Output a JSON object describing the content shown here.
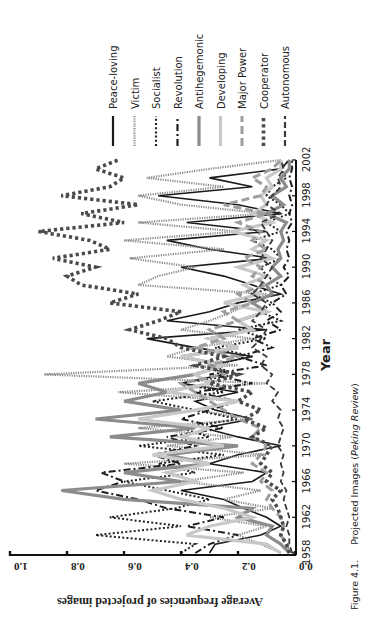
{
  "figure": {
    "caption_label": "Figure 4.1.",
    "caption_text": "Projected Images (",
    "caption_italic": "Peking Review",
    "caption_close": ")"
  },
  "chart_data": {
    "type": "line",
    "title": "Projected Images (Peking Review)",
    "xlabel": "Year",
    "ylabel": "Average frequencies of projected images",
    "xlim": [
      1958,
      2002
    ],
    "ylim": [
      0.0,
      1.0
    ],
    "x_ticks": [
      1958,
      1962,
      1966,
      1970,
      1974,
      1978,
      1982,
      1986,
      1990,
      1994,
      1998,
      2002
    ],
    "y_ticks": [
      "0.0",
      "0.2",
      "0.4",
      "0.6",
      "0.8",
      "1.0"
    ],
    "grid": false,
    "legend_position": "right (top of rotated page)",
    "orientation": "rotated 90deg counter-clockwise on page",
    "x": [
      1958,
      1959,
      1960,
      1961,
      1962,
      1963,
      1964,
      1965,
      1966,
      1967,
      1968,
      1969,
      1970,
      1971,
      1972,
      1973,
      1974,
      1975,
      1976,
      1977,
      1978,
      1979,
      1980,
      1981,
      1982,
      1983,
      1984,
      1985,
      1986,
      1987,
      1988,
      1989,
      1990,
      1991,
      1992,
      1993,
      1994,
      1995,
      1996,
      1997,
      1998,
      1999,
      2000,
      2001,
      2002
    ],
    "series": [
      {
        "name": "Peace-loving",
        "style": "solid",
        "color": "#1a1a1a",
        "width": 1.6,
        "values": [
          0.3,
          0.28,
          0.12,
          0.05,
          0.1,
          0.18,
          0.25,
          0.4,
          0.15,
          0.1,
          0.3,
          0.2,
          0.05,
          0.2,
          0.32,
          0.15,
          0.28,
          0.35,
          0.2,
          0.4,
          0.25,
          0.3,
          0.15,
          0.35,
          0.52,
          0.1,
          0.45,
          0.3,
          0.2,
          0.05,
          0.15,
          0.25,
          0.4,
          0.08,
          0.3,
          0.45,
          0.1,
          0.38,
          0.05,
          0.2,
          0.48,
          0.15,
          0.3,
          0.05,
          0.02
        ]
      },
      {
        "name": "Victim",
        "style": "dotted-fine",
        "color": "#8a8a8a",
        "width": 2.2,
        "values": [
          0.05,
          0.12,
          0.2,
          0.1,
          0.3,
          0.08,
          0.25,
          0.12,
          0.4,
          0.18,
          0.6,
          0.1,
          0.45,
          0.22,
          0.55,
          0.15,
          0.35,
          0.2,
          0.62,
          0.1,
          0.88,
          0.2,
          0.45,
          0.35,
          0.15,
          0.4,
          0.3,
          0.22,
          0.15,
          0.1,
          0.55,
          0.48,
          0.35,
          0.58,
          0.25,
          0.6,
          0.2,
          0.55,
          0.1,
          0.4,
          0.55,
          0.25,
          0.52,
          0.3,
          0.05
        ]
      },
      {
        "name": "Socialist",
        "style": "dotted",
        "color": "#222222",
        "width": 2.0,
        "values": [
          0.4,
          0.35,
          0.7,
          0.4,
          0.65,
          0.42,
          0.3,
          0.45,
          0.6,
          0.35,
          0.48,
          0.25,
          0.55,
          0.3,
          0.4,
          0.2,
          0.35,
          0.5,
          0.25,
          0.4,
          0.2,
          0.3,
          0.15,
          0.28,
          0.1,
          0.2,
          0.05,
          0.12,
          0.08,
          0.15,
          0.05,
          0.1,
          0.12,
          0.05,
          0.08,
          0.15,
          0.05,
          0.1,
          0.02,
          0.05,
          0.1,
          0.08,
          0.03,
          0.05,
          0.02
        ]
      },
      {
        "name": "Revolution",
        "style": "dashdot",
        "color": "#1e1e1e",
        "width": 2.0,
        "values": [
          0.35,
          0.3,
          0.2,
          0.38,
          0.25,
          0.45,
          0.55,
          0.7,
          0.6,
          0.68,
          0.4,
          0.5,
          0.35,
          0.45,
          0.25,
          0.4,
          0.3,
          0.2,
          0.35,
          0.15,
          0.3,
          0.1,
          0.2,
          0.08,
          0.15,
          0.05,
          0.1,
          0.05,
          0.08,
          0.03,
          0.05,
          0.02,
          0.04,
          0.02,
          0.03,
          0.02,
          0.03,
          0.01,
          0.02,
          0.01,
          0.02,
          0.01,
          0.02,
          0.01,
          0.01
        ]
      },
      {
        "name": "Antihegemonic",
        "style": "solid-thick",
        "color": "#8c8c8c",
        "width": 3.2,
        "values": [
          0.02,
          0.05,
          0.1,
          0.08,
          0.2,
          0.15,
          0.6,
          0.82,
          0.4,
          0.6,
          0.3,
          0.45,
          0.2,
          0.65,
          0.35,
          0.7,
          0.4,
          0.6,
          0.45,
          0.55,
          0.35,
          0.25,
          0.4,
          0.2,
          0.3,
          0.15,
          0.2,
          0.1,
          0.15,
          0.08,
          0.1,
          0.05,
          0.08,
          0.05,
          0.06,
          0.04,
          0.05,
          0.03,
          0.1,
          0.04,
          0.08,
          0.03,
          0.05,
          0.02,
          0.02
        ]
      },
      {
        "name": "Developing",
        "style": "solid-thick",
        "color": "#c8c8c8",
        "width": 3.2,
        "values": [
          0.05,
          0.1,
          0.38,
          0.3,
          0.15,
          0.25,
          0.4,
          0.5,
          0.35,
          0.45,
          0.3,
          0.5,
          0.25,
          0.4,
          0.3,
          0.55,
          0.35,
          0.2,
          0.45,
          0.3,
          0.35,
          0.25,
          0.4,
          0.2,
          0.3,
          0.15,
          0.2,
          0.1,
          0.25,
          0.12,
          0.18,
          0.1,
          0.2,
          0.08,
          0.15,
          0.1,
          0.22,
          0.08,
          0.15,
          0.1,
          0.12,
          0.08,
          0.1,
          0.05,
          0.05
        ]
      },
      {
        "name": "Major Power",
        "style": "dashed-thick",
        "color": "#9e9e9e",
        "width": 3.0,
        "values": [
          0.02,
          0.03,
          0.05,
          0.04,
          0.05,
          0.08,
          0.1,
          0.08,
          0.12,
          0.1,
          0.15,
          0.12,
          0.1,
          0.15,
          0.12,
          0.2,
          0.25,
          0.3,
          0.35,
          0.4,
          0.25,
          0.3,
          0.2,
          0.35,
          0.25,
          0.3,
          0.2,
          0.25,
          0.15,
          0.2,
          0.1,
          0.15,
          0.12,
          0.18,
          0.1,
          0.15,
          0.12,
          0.2,
          0.1,
          0.25,
          0.12,
          0.1,
          0.15,
          0.08,
          0.05
        ]
      },
      {
        "name": "Cooperator",
        "style": "dotted-heavy",
        "color": "#4a4a4a",
        "width": 3.6,
        "values": [
          0.02,
          0.03,
          0.05,
          0.04,
          0.05,
          0.06,
          0.08,
          0.05,
          0.1,
          0.08,
          0.12,
          0.1,
          0.08,
          0.15,
          0.1,
          0.18,
          0.12,
          0.2,
          0.15,
          0.3,
          0.2,
          0.35,
          0.25,
          0.4,
          0.45,
          0.58,
          0.48,
          0.4,
          0.65,
          0.55,
          0.75,
          0.8,
          0.7,
          0.85,
          0.65,
          0.72,
          0.9,
          0.6,
          0.75,
          0.55,
          0.82,
          0.65,
          0.6,
          0.7,
          0.62
        ]
      },
      {
        "name": "Autonomous",
        "style": "dashed",
        "color": "#3a3a3a",
        "width": 1.8,
        "values": [
          0.01,
          0.02,
          0.02,
          0.03,
          0.02,
          0.03,
          0.04,
          0.03,
          0.05,
          0.04,
          0.05,
          0.04,
          0.06,
          0.05,
          0.04,
          0.06,
          0.05,
          0.08,
          0.06,
          0.1,
          0.08,
          0.12,
          0.1,
          0.15,
          0.12,
          0.1,
          0.15,
          0.12,
          0.1,
          0.15,
          0.12,
          0.1,
          0.08,
          0.12,
          0.1,
          0.08,
          0.1,
          0.12,
          0.05,
          0.1,
          0.08,
          0.05,
          0.06,
          0.04,
          0.05
        ]
      }
    ]
  }
}
